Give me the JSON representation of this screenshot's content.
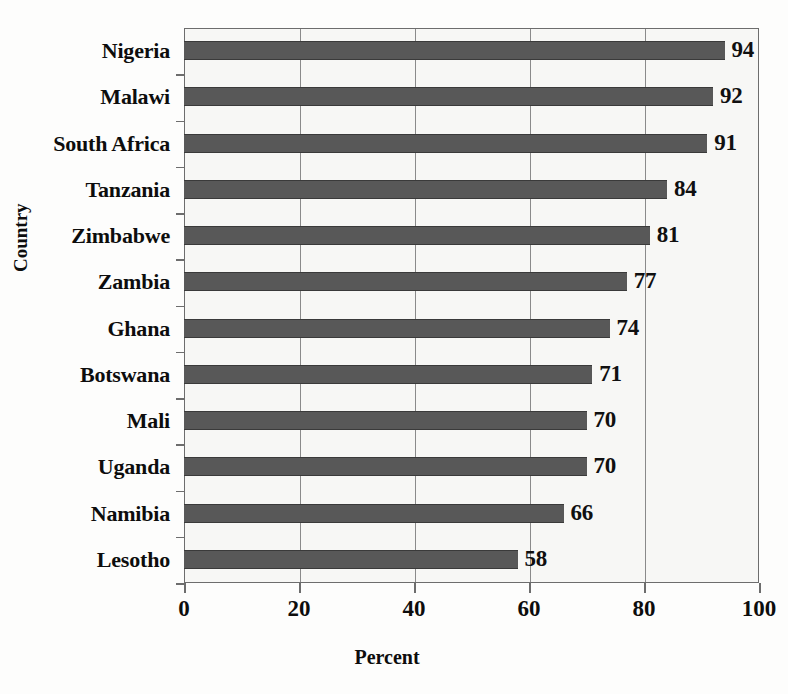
{
  "chart_data": {
    "type": "bar",
    "orientation": "horizontal",
    "title": "",
    "xlabel": "Percent",
    "ylabel": "Country",
    "xlim": [
      0,
      100
    ],
    "xticks": [
      0,
      20,
      40,
      60,
      80,
      100
    ],
    "xtick_labels": [
      "0",
      "20",
      "40",
      "60",
      "80",
      "100"
    ],
    "grid": "vertical",
    "legend": "none",
    "categories": [
      "Nigeria",
      "Malawi",
      "South Africa",
      "Tanzania",
      "Zimbabwe",
      "Zambia",
      "Ghana",
      "Botswana",
      "Mali",
      "Uganda",
      "Namibia",
      "Lesotho"
    ],
    "values": [
      94,
      92,
      91,
      84,
      81,
      77,
      74,
      71,
      70,
      70,
      66,
      58
    ],
    "value_labels": [
      "94",
      "92",
      "91",
      "84",
      "81",
      "77",
      "74",
      "71",
      "70",
      "70",
      "66",
      "58"
    ],
    "bar_color": "#585858",
    "plot_background": "#f7f7f5",
    "axis_color": "#6d6d6d",
    "grid_color": "#8a8a8a"
  }
}
